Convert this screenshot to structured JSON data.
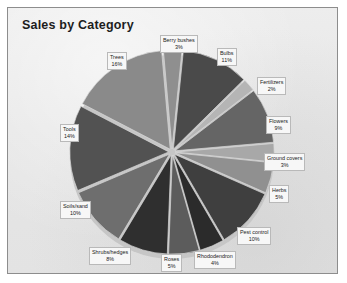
{
  "chart": {
    "title": "Sales by Category",
    "panel_bg": "#e9e9e9",
    "panel_border": "#8d8d8d",
    "label_bg": "#f7f7f7",
    "label_border": "#b9b9b9"
  },
  "chart_data": {
    "type": "pie",
    "title": "Sales by Category",
    "xlabel": "",
    "ylabel": "",
    "legend": "none",
    "exploded": true,
    "units": "percent",
    "categories": [
      "Berry bushes",
      "Bulbs",
      "Fertilizers",
      "Flowers",
      "Ground covers",
      "Herbs",
      "Pest control",
      "Rhododendron",
      "Roses",
      "Shrubs/hedges",
      "Soils/sand",
      "Tools",
      "Trees"
    ],
    "values": [
      3,
      11,
      2,
      9,
      3,
      5,
      10,
      4,
      5,
      8,
      10,
      14,
      16
    ],
    "slices": [
      {
        "label": "Berry bushes",
        "value": 3,
        "pct_text": "3%",
        "color": "#8f8f8f"
      },
      {
        "label": "Bulbs",
        "value": 11,
        "pct_text": "11%",
        "color": "#4a4a4a"
      },
      {
        "label": "Fertilizers",
        "value": 2,
        "pct_text": "2%",
        "color": "#b5b5b5"
      },
      {
        "label": "Flowers",
        "value": 9,
        "pct_text": "9%",
        "color": "#656565"
      },
      {
        "label": "Ground covers",
        "value": 3,
        "pct_text": "3%",
        "color": "#a8a8a8"
      },
      {
        "label": "Herbs",
        "value": 5,
        "pct_text": "5%",
        "color": "#909090"
      },
      {
        "label": "Pest control",
        "value": 10,
        "pct_text": "10%",
        "color": "#3f3f3f"
      },
      {
        "label": "Rhododendron",
        "value": 4,
        "pct_text": "4%",
        "color": "#2b2b2b"
      },
      {
        "label": "Roses",
        "value": 5,
        "pct_text": "5%",
        "color": "#5c5c5c"
      },
      {
        "label": "Shrubs/hedges",
        "value": 8,
        "pct_text": "8%",
        "color": "#2f2f2f"
      },
      {
        "label": "Soils/sand",
        "value": 10,
        "pct_text": "10%",
        "color": "#6e6e6e"
      },
      {
        "label": "Tools",
        "value": 14,
        "pct_text": "14%",
        "color": "#525252"
      },
      {
        "label": "Trees",
        "value": 16,
        "pct_text": "16%",
        "color": "#8a8a8a"
      }
    ]
  },
  "callouts": [
    {
      "cat": "Berry bushes",
      "pct": "3%",
      "left": 152,
      "top": 27
    },
    {
      "cat": "Bulbs",
      "pct": "11%",
      "left": 209,
      "top": 40
    },
    {
      "cat": "Fertilizers",
      "pct": "2%",
      "left": 249,
      "top": 69
    },
    {
      "cat": "Flowers",
      "pct": "9%",
      "left": 258,
      "top": 108
    },
    {
      "cat": "Ground covers",
      "pct": "3%",
      "left": 256,
      "top": 145
    },
    {
      "cat": "Herbs",
      "pct": "5%",
      "left": 261,
      "top": 177
    },
    {
      "cat": "Pest control",
      "pct": "10%",
      "left": 229,
      "top": 219
    },
    {
      "cat": "Rhododendron",
      "pct": "4%",
      "left": 186,
      "top": 243
    },
    {
      "cat": "Roses",
      "pct": "5%",
      "left": 153,
      "top": 246
    },
    {
      "cat": "Shrubs/hedges",
      "pct": "8%",
      "left": 81,
      "top": 239
    },
    {
      "cat": "Soils/sand",
      "pct": "10%",
      "left": 52,
      "top": 193
    },
    {
      "cat": "Tools",
      "pct": "14%",
      "left": 52,
      "top": 116
    },
    {
      "cat": "Trees",
      "pct": "16%",
      "left": 99,
      "top": 44
    }
  ]
}
